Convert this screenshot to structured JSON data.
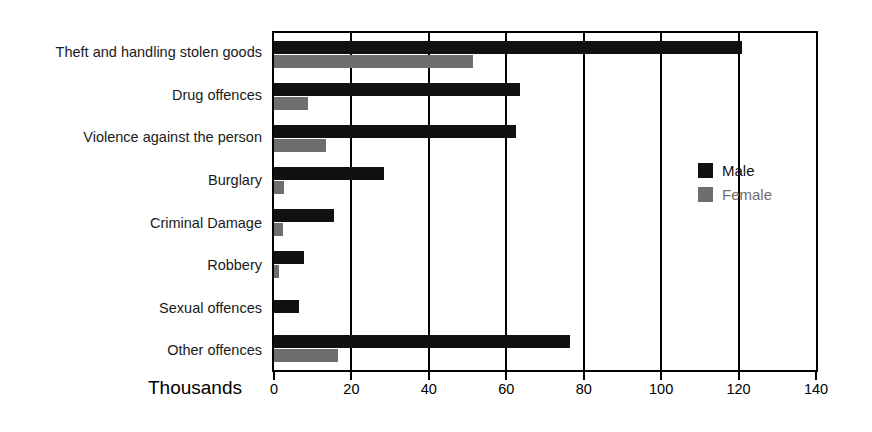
{
  "chart_data": {
    "type": "bar",
    "orientation": "horizontal",
    "title": "",
    "subtitle": "",
    "xlabel": "Thousands",
    "ylabel": "",
    "xlim": [
      0,
      140
    ],
    "xticks": [
      0,
      20,
      40,
      60,
      80,
      100,
      120,
      140
    ],
    "xtick_labels": [
      "0",
      "20",
      "40",
      "60",
      "80",
      "100",
      "120",
      "140"
    ],
    "grid": "vertical",
    "legend_position": "inside-right",
    "categories": [
      "Theft and handling stolen goods",
      "Drug offences",
      "Violence against the person",
      "Burglary",
      "Criminal Damage",
      "Robbery",
      "Sexual offences",
      "Other offences"
    ],
    "series": [
      {
        "name": "Male",
        "color": "#111111",
        "values": [
          121,
          63.5,
          62.5,
          28.5,
          15.5,
          7.8,
          6.5,
          76.5
        ]
      },
      {
        "name": "Female",
        "color": "#6e6e6e",
        "values": [
          51.5,
          8.8,
          13.5,
          2.5,
          2.3,
          1.3,
          0,
          16.5
        ]
      }
    ]
  },
  "legend": {
    "items": [
      {
        "label": "Male",
        "color": "#111111"
      },
      {
        "label": "Female",
        "color": "#6e6e6e"
      }
    ]
  },
  "axis": {
    "title": "Thousands"
  }
}
